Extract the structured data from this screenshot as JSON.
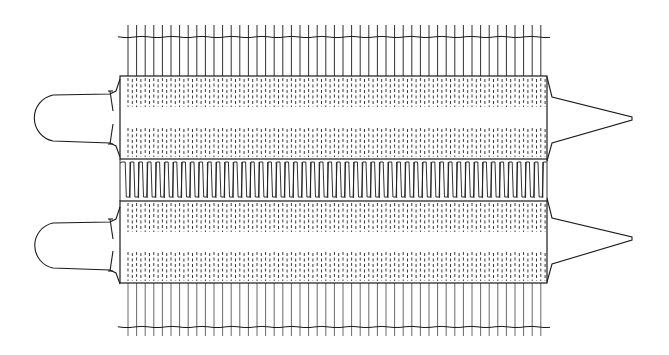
{
  "figure": {
    "kind": "technical line drawing",
    "ink_color": "#1a1a1a",
    "background": "#ffffff"
  },
  "geometry": {
    "fin_x_start": 128,
    "fin_x_end": 541,
    "fin_pitch": 8.6,
    "top_fins": {
      "y1": 25,
      "y2": 76,
      "rail_y": 37
    },
    "bottom_fins": {
      "y1": 283,
      "y2": 336,
      "rail_y": 327
    },
    "rail_x1": 118,
    "rail_x2": 551,
    "core_x1": 120,
    "core_x2": 547,
    "upper_core": {
      "y1": 76,
      "y2": 159,
      "dash_bands": [
        [
          78,
          107
        ],
        [
          128,
          157
        ]
      ]
    },
    "serpentine": {
      "y1": 159,
      "y2": 201
    },
    "lower_core": {
      "y1": 201,
      "y2": 283,
      "dash_bands": [
        [
          203,
          232
        ],
        [
          252,
          281
        ]
      ]
    },
    "left_loops": [
      {
        "cy": 117,
        "top": 94,
        "bottom": 141
      },
      {
        "cy": 242,
        "top": 222,
        "bottom": 268
      }
    ],
    "right_cones": [
      {
        "cy": 119,
        "top": 97,
        "bottom": 143,
        "tip_x": 632
      },
      {
        "cy": 239,
        "top": 218,
        "bottom": 264,
        "tip_x": 632
      }
    ]
  }
}
